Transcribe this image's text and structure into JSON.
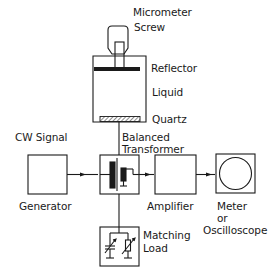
{
  "diagram": {
    "colors": {
      "stroke": "#1a1a1a",
      "background": "#ffffff"
    },
    "labels": {
      "micrometer": "Micrometer",
      "screw": "Screw",
      "reflector": "Reflector",
      "liquid": "Liquid",
      "quartz": "Quartz",
      "cw_signal": "CW Signal",
      "generator": "Generator",
      "balanced": "Balanced",
      "transformer": "Transformer",
      "amplifier": "Amplifier",
      "meter": "Meter",
      "or": "or",
      "oscilloscope": "Oscilloscope",
      "matching": "Matching",
      "load": "Load"
    },
    "nodes": [
      {
        "id": "cell",
        "label": "Liquid cell with reflector and quartz"
      },
      {
        "id": "generator",
        "label": "Generator"
      },
      {
        "id": "transformer",
        "label": "Balanced Transformer"
      },
      {
        "id": "amplifier",
        "label": "Amplifier"
      },
      {
        "id": "meter",
        "label": "Meter or Oscilloscope"
      },
      {
        "id": "matching_load",
        "label": "Matching Load"
      }
    ],
    "edges": [
      {
        "from": "generator",
        "to": "transformer",
        "arrow": true
      },
      {
        "from": "transformer",
        "to": "amplifier",
        "arrow": true
      },
      {
        "from": "amplifier",
        "to": "meter",
        "arrow": true
      },
      {
        "from": "cell",
        "to": "transformer",
        "arrow": false
      },
      {
        "from": "transformer",
        "to": "matching_load",
        "arrow": false
      }
    ]
  }
}
